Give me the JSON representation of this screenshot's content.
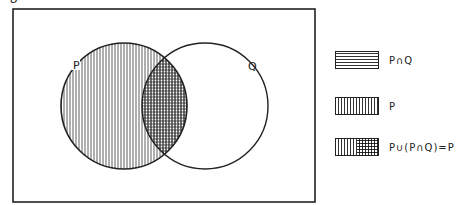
{
  "diagram": {
    "universe_label": "U",
    "sets": [
      {
        "name": "P",
        "label": "P"
      },
      {
        "name": "Q",
        "label": "Q"
      }
    ],
    "legend": [
      {
        "pattern": "horizontal-lines",
        "label": "P∩Q"
      },
      {
        "pattern": "vertical-lines",
        "label": "P"
      },
      {
        "pattern": "vertical-and-crosshatch",
        "label": "P∪(P∩Q)=P"
      }
    ]
  }
}
